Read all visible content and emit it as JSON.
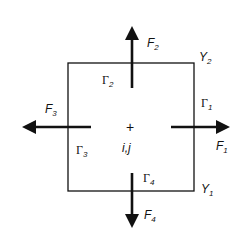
{
  "diagram": {
    "center_marker": "+",
    "center_label": "i,j",
    "forces": [
      {
        "name": "F",
        "sub": "1",
        "direction": "right"
      },
      {
        "name": "F",
        "sub": "2",
        "direction": "up"
      },
      {
        "name": "F",
        "sub": "3",
        "direction": "left"
      },
      {
        "name": "F",
        "sub": "4",
        "direction": "down"
      }
    ],
    "boundaries": [
      {
        "name": "Γ",
        "sub": "1",
        "side": "right"
      },
      {
        "name": "Γ",
        "sub": "2",
        "side": "top"
      },
      {
        "name": "Γ",
        "sub": "3",
        "side": "left"
      },
      {
        "name": "Γ",
        "sub": "4",
        "side": "bottom"
      }
    ],
    "corners": [
      {
        "name": "Y",
        "sub": "2",
        "position": "top-right"
      },
      {
        "name": "Y",
        "sub": "1",
        "position": "bottom-right"
      }
    ],
    "stroke_color": "#111111"
  }
}
